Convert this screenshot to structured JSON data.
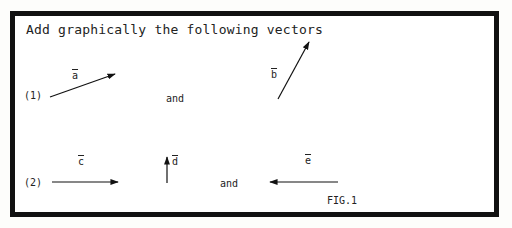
{
  "title": "Add graphically the following vectors",
  "problems": [
    {
      "number": "(1)",
      "connector": "and",
      "vectors": [
        {
          "name": "a",
          "label": "a",
          "from": [
            50,
            97
          ],
          "to": [
            115,
            74
          ]
        },
        {
          "name": "b",
          "label": "b",
          "from": [
            278,
            99
          ],
          "to": [
            309,
            42
          ]
        }
      ]
    },
    {
      "number": "(2)",
      "connector": "and",
      "vectors": [
        {
          "name": "c",
          "label": "c",
          "from": [
            52,
            182
          ],
          "to": [
            118,
            182
          ]
        },
        {
          "name": "d",
          "label": "d",
          "from": [
            167,
            183
          ],
          "to": [
            167,
            158
          ]
        },
        {
          "name": "e",
          "label": "e",
          "from": [
            338,
            182
          ],
          "to": [
            270,
            182
          ]
        }
      ]
    }
  ],
  "figure_caption": "FIG.1"
}
